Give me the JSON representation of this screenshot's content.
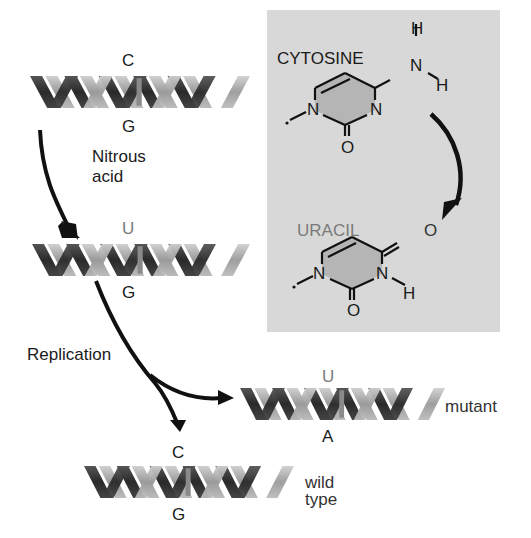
{
  "helices": {
    "original": {
      "top_base": "C",
      "bottom_base": "G"
    },
    "deaminated": {
      "top_base": "U",
      "bottom_base": "G"
    },
    "mutant": {
      "top_base": "U",
      "bottom_base": "A",
      "label": "mutant"
    },
    "wild_type": {
      "top_base": "C",
      "bottom_base": "G",
      "label": "wild type"
    }
  },
  "arrows": {
    "step1_label": [
      "Nitrous",
      "acid"
    ],
    "step2_label": "Replication"
  },
  "panel": {
    "background": "#d8d8d8",
    "ring_fill": "#b5b5b5",
    "cytosine": {
      "name": "CYTOSINE",
      "atoms": {
        "n1": "N",
        "n3": "N",
        "o2": "O",
        "amine_n": "N",
        "h_top": "H",
        "h_right": "H"
      }
    },
    "uracil": {
      "name": "URACIL",
      "name_color": "#7a7a7a",
      "atoms": {
        "n1": "N",
        "n3": "N",
        "o2": "O",
        "o4": "O",
        "h3": "H"
      }
    }
  },
  "colors": {
    "strand_dark": "#3a3a3a",
    "strand_light": "#a8a8a8",
    "text": "#1a1a1a",
    "gray_text": "#7a7a7a"
  }
}
